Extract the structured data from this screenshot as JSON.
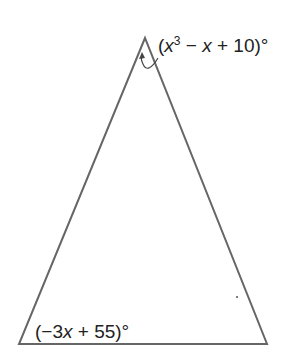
{
  "diagram": {
    "type": "triangle",
    "vertices": {
      "apex": [
        145,
        38
      ],
      "bottom_left": [
        19,
        344
      ],
      "bottom_right": [
        267,
        344
      ]
    },
    "stroke_color": "#666666",
    "angles": [
      {
        "vertex": "apex",
        "expression": "(x³ − x + 10)°",
        "parts": {
          "open": "(",
          "var1": "x",
          "exp": "3",
          "mid1": " − ",
          "var2": "x",
          "rest": " + 10)°"
        }
      },
      {
        "vertex": "bottom_left",
        "expression": "(−3x + 55)°",
        "parts": {
          "open": "(−3",
          "var1": "x",
          "rest": " + 55)°"
        }
      }
    ]
  }
}
